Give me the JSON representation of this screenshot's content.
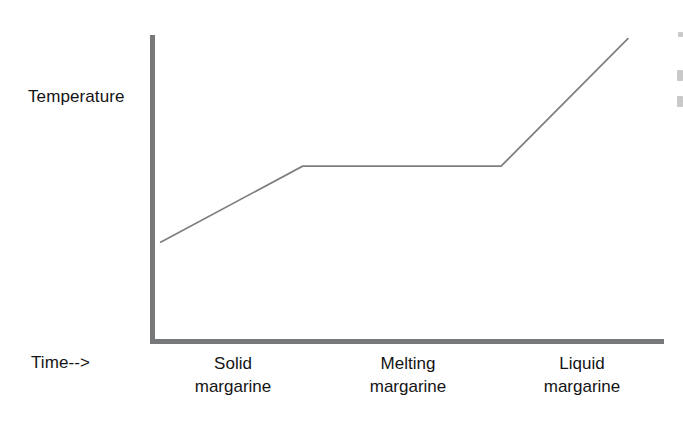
{
  "figure": {
    "background_color": "#ffffff",
    "axis_color": "#76787a",
    "curve_color": "#7c7e80",
    "text_color": "#141414"
  },
  "axes": {
    "y_label": "Temperature",
    "x_label": "Time-->"
  },
  "phases": [
    {
      "line1": "Solid",
      "line2": "margarine"
    },
    {
      "line1": "Melting",
      "line2": "margarine"
    },
    {
      "line1": "Liquid",
      "line2": "margarine"
    }
  ],
  "chart_data": {
    "type": "line",
    "title": "",
    "subtitle": "",
    "xlabel": "Time-->",
    "ylabel": "Temperature",
    "grid": false,
    "legend": false,
    "axis_ticks": {
      "x": [],
      "y": []
    },
    "xlim": [
      0,
      100
    ],
    "ylim": [
      0,
      100
    ],
    "series": [
      {
        "name": "Temperature of margarine",
        "x": [
          1,
          29,
          68,
          93
        ],
        "y": [
          32,
          57,
          57,
          99
        ],
        "points": [
          {
            "x": 1,
            "y": 32,
            "note": "start of heating, solid margarine"
          },
          {
            "x": 29,
            "y": 57,
            "note": "melting point reached, plateau begins"
          },
          {
            "x": 68,
            "y": 57,
            "note": "melting complete, plateau ends"
          },
          {
            "x": 93,
            "y": 99,
            "note": "liquid margarine continues heating"
          }
        ]
      }
    ],
    "annotations": [
      {
        "text": "Solid margarine",
        "x_center": 16,
        "region": [
          0,
          30
        ]
      },
      {
        "text": "Melting margarine",
        "x_center": 50,
        "region": [
          30,
          68
        ]
      },
      {
        "text": "Liquid margarine",
        "x_center": 84,
        "region": [
          68,
          100
        ]
      }
    ]
  }
}
